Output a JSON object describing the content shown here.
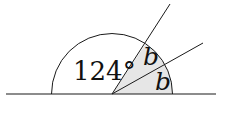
{
  "diagram": {
    "type": "geometry-angles-on-straight-line",
    "angle_label": "124°",
    "shaded_angles": [
      {
        "label": "b"
      },
      {
        "label": "b"
      }
    ],
    "colors": {
      "line": "#1a1a1a",
      "shade": "#e6e6e6",
      "background": "#ffffff"
    }
  }
}
